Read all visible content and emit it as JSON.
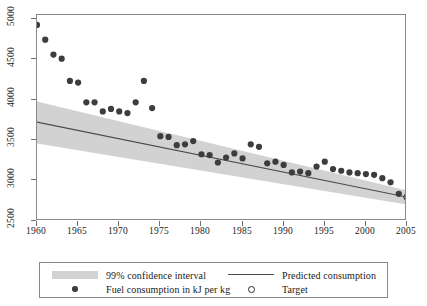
{
  "chart_data": {
    "type": "scatter",
    "title": "",
    "xlabel": "",
    "ylabel": "",
    "xlim": [
      1960,
      2005
    ],
    "ylim": [
      2500,
      5000
    ],
    "grid": false,
    "legend_position": "bottom",
    "x_ticks": [
      1960,
      1965,
      1970,
      1975,
      1980,
      1985,
      1990,
      1995,
      2000,
      2005
    ],
    "y_ticks": [
      2500,
      3000,
      3500,
      4000,
      4500,
      5000
    ],
    "series": [
      {
        "name": "Fuel consumption in kJ per kg",
        "type": "scatter",
        "marker": "filled-circle",
        "color": "#3d3d3d",
        "x": [
          1960,
          1961,
          1962,
          1963,
          1964,
          1965,
          1966,
          1967,
          1968,
          1969,
          1970,
          1971,
          1972,
          1973,
          1974,
          1975,
          1976,
          1977,
          1978,
          1979,
          1980,
          1981,
          1982,
          1983,
          1984,
          1985,
          1986,
          1987,
          1988,
          1989,
          1990,
          1991,
          1992,
          1993,
          1994,
          1995,
          1996,
          1997,
          1998,
          1999,
          2000,
          2001,
          2002,
          2003,
          2004
        ],
        "y": [
          4880,
          4700,
          4520,
          4470,
          4200,
          4180,
          3940,
          3940,
          3830,
          3860,
          3830,
          3810,
          3940,
          4200,
          3870,
          3530,
          3520,
          3420,
          3430,
          3470,
          3310,
          3300,
          3210,
          3270,
          3320,
          3260,
          3430,
          3400,
          3200,
          3220,
          3180,
          3090,
          3100,
          3080,
          3160,
          3220,
          3130,
          3110,
          3090,
          3080,
          3070,
          3060,
          3020,
          2970,
          2830
        ]
      },
      {
        "name": "Predicted consumption",
        "type": "line",
        "color": "#4a4a4a",
        "x": [
          1960,
          2005
        ],
        "y": [
          3700,
          2790
        ]
      },
      {
        "name": "99% confidence interval",
        "type": "band",
        "color": "#d2d2d2",
        "x": [
          1960,
          2005
        ],
        "y_upper": [
          3950,
          2870
        ],
        "y_lower": [
          3440,
          2700
        ]
      },
      {
        "name": "Target",
        "type": "scatter",
        "marker": "open-circle",
        "color": "#2b2b2b",
        "x": [
          2005
        ],
        "y": [
          2790
        ]
      }
    ]
  },
  "axes": {
    "y_tick_labels": [
      "2500",
      "3000",
      "3500",
      "4000",
      "4500",
      "5000"
    ],
    "x_tick_labels": [
      "1960",
      "1965",
      "1970",
      "1975",
      "1980",
      "1985",
      "1990",
      "1995",
      "2000",
      "2005"
    ]
  },
  "legend": {
    "entries": [
      {
        "key": "band",
        "label": "99% confidence interval"
      },
      {
        "key": "filled-dot",
        "label": "Fuel consumption in kJ per kg"
      },
      {
        "key": "line",
        "label": "Predicted consumption"
      },
      {
        "key": "open-circle",
        "label": "Target"
      }
    ]
  },
  "colors": {
    "band": "#d2d2d2",
    "point": "#3d3d3d",
    "line": "#4a4a4a",
    "frame": "#8a8a8a",
    "text": "#1a1a1a"
  }
}
